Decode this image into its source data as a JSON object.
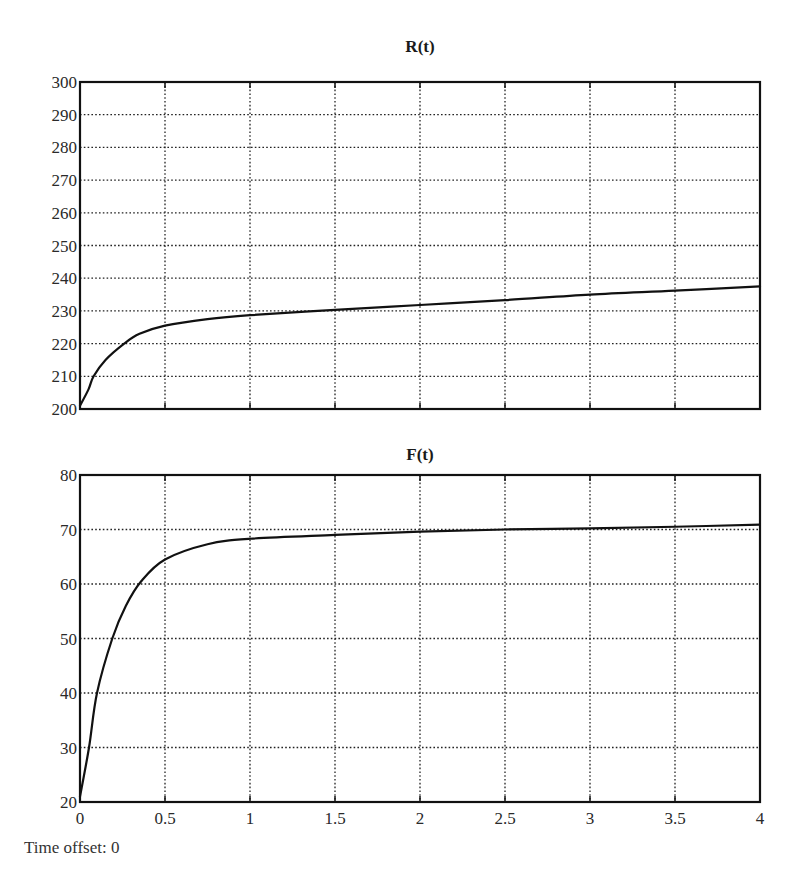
{
  "footer": {
    "time_offset_label": "Time offset: 0"
  },
  "chart_data": [
    {
      "type": "line",
      "title": "R(t)",
      "xlabel": "",
      "ylabel": "",
      "xlim": [
        0,
        4
      ],
      "ylim": [
        200,
        300
      ],
      "grid": true,
      "x_ticks": [
        "0",
        "0.5",
        "1",
        "1.5",
        "2",
        "2.5",
        "3",
        "3.5",
        "4"
      ],
      "y_ticks": [
        "200",
        "210",
        "220",
        "230",
        "240",
        "250",
        "260",
        "270",
        "280",
        "290",
        "300"
      ],
      "series": [
        {
          "name": "R(t)",
          "x": [
            0,
            0.05,
            0.08,
            0.15,
            0.26,
            0.35,
            0.5,
            0.75,
            1.0,
            1.5,
            2.0,
            2.5,
            3.0,
            3.5,
            4.0
          ],
          "values": [
            201,
            206,
            210,
            215,
            220,
            223,
            225.5,
            227.5,
            228.7,
            230.3,
            231.8,
            233.3,
            235.0,
            236.2,
            237.5
          ]
        }
      ]
    },
    {
      "type": "line",
      "title": "F(t)",
      "xlabel": "",
      "ylabel": "",
      "xlim": [
        0,
        4
      ],
      "ylim": [
        20,
        80
      ],
      "grid": true,
      "x_ticks": [
        "0",
        "0.5",
        "1",
        "1.5",
        "2",
        "2.5",
        "3",
        "3.5",
        "4"
      ],
      "y_ticks": [
        "20",
        "30",
        "40",
        "50",
        "60",
        "70",
        "80"
      ],
      "series": [
        {
          "name": "F(t)",
          "x": [
            0,
            0.053,
            0.1,
            0.19,
            0.27,
            0.36,
            0.5,
            0.75,
            1.0,
            1.5,
            2.0,
            2.5,
            3.0,
            3.5,
            4.0
          ],
          "values": [
            21,
            30,
            40,
            50,
            56,
            60.5,
            64.5,
            67.3,
            68.3,
            69.0,
            69.6,
            70.0,
            70.2,
            70.5,
            70.9
          ]
        }
      ]
    }
  ]
}
